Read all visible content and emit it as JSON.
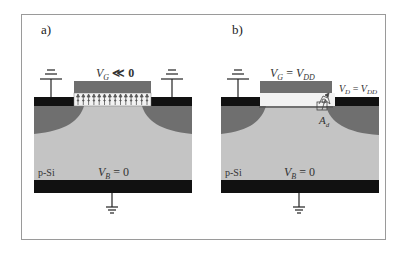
{
  "figure": {
    "panels": [
      {
        "label": "a)",
        "gate_voltage": "V_G ≪ 0",
        "gate_voltage_main": "V",
        "gate_voltage_sub": "G",
        "gate_voltage_rest": " ≪ 0",
        "substrate_label": "p-Si",
        "bulk_voltage_main": "V",
        "bulk_voltage_sub": "B",
        "bulk_voltage_rest": " = 0",
        "oxide_field_arrows": 14
      },
      {
        "label": "b)",
        "gate_voltage_main": "V",
        "gate_voltage_sub": "G",
        "gate_voltage_eq": " = ",
        "gate_voltage_rhs": "V",
        "gate_voltage_rhs_sub": "DD",
        "drain_voltage_main": "V",
        "drain_voltage_sub": "D",
        "drain_voltage_eq": " = ",
        "drain_voltage_rhs": "V",
        "drain_voltage_rhs_sub": "DD",
        "hot_carrier_label_main": "A",
        "hot_carrier_label_sub": "d",
        "substrate_label": "p-Si",
        "bulk_voltage_main": "V",
        "bulk_voltage_sub": "B",
        "bulk_voltage_rest": " = 0"
      }
    ],
    "colors": {
      "contact": "#111111",
      "gate": "#6e6e6e",
      "depletion": "#6f6f6f",
      "substrate": "#c4c4c4",
      "oxide": "#f2f2f2",
      "frame": "#9a9a9a",
      "channel": "#555555"
    }
  }
}
